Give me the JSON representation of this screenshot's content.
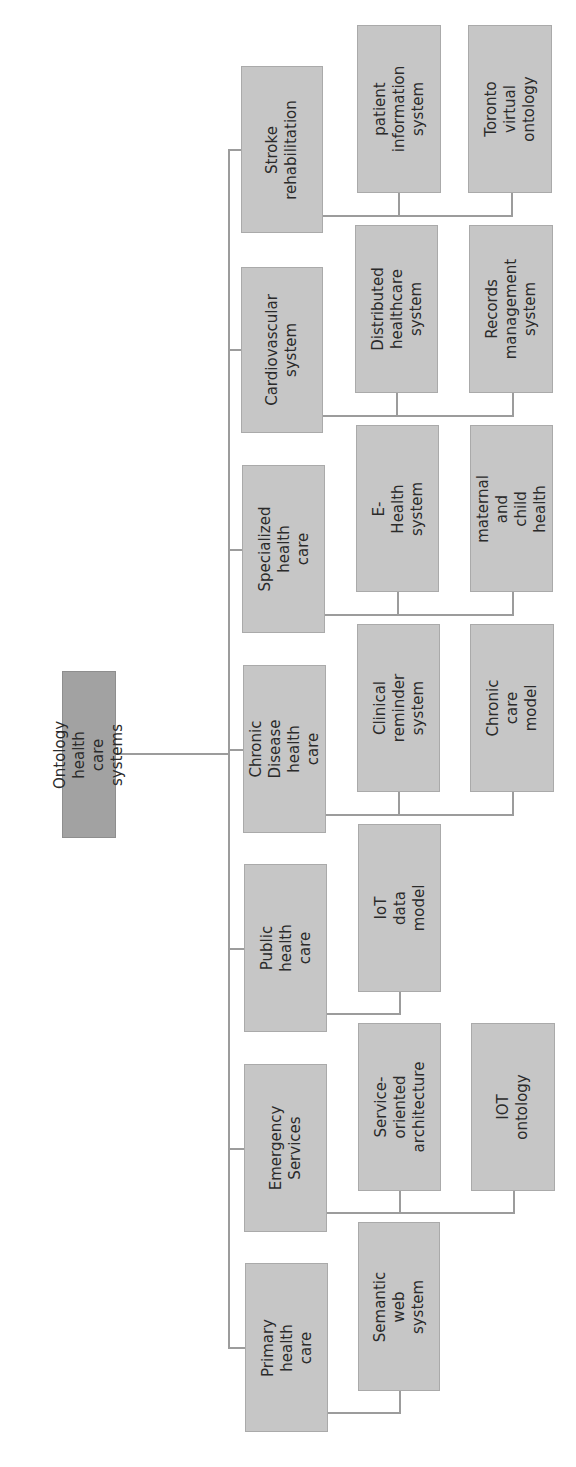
{
  "diagram": {
    "type": "tree",
    "orientation": "rotated-90-ccw",
    "colors": {
      "root_fill": "#a2a2a2",
      "node_fill": "#c6c6c6",
      "line": "#9c9c9c",
      "text": "#2a2a2a"
    },
    "root": {
      "label": "Ontology health\ncare systems"
    },
    "categories": [
      {
        "label": "Stroke\nrehabilitation",
        "children": [
          {
            "label": "patient\ninformation\nsystem"
          },
          {
            "label": "Toronto virtual\nontology"
          }
        ]
      },
      {
        "label": "Cardiovascular\nsystem",
        "children": [
          {
            "label": "Distributed\nhealthcare system"
          },
          {
            "label": "Records\nmanagement\nsystem"
          }
        ]
      },
      {
        "label": "Specialized health\ncare",
        "children": [
          {
            "label": "E-Health system"
          },
          {
            "label": "maternal and child\nhealth"
          }
        ]
      },
      {
        "label": "Chronic Disease\nhealth care",
        "children": [
          {
            "label": "Clinical reminder\nsystem"
          },
          {
            "label": "Chronic care\nmodel"
          }
        ]
      },
      {
        "label": "Public health care",
        "children": [
          {
            "label": "IoT data model"
          }
        ]
      },
      {
        "label": "Emergency\nServices",
        "children": [
          {
            "label": "Service-oriented\narchitecture"
          },
          {
            "label": "IOT ontology"
          }
        ]
      },
      {
        "label": "Primary health\ncare",
        "children": [
          {
            "label": "Semantic web\nsystem"
          }
        ]
      }
    ]
  }
}
